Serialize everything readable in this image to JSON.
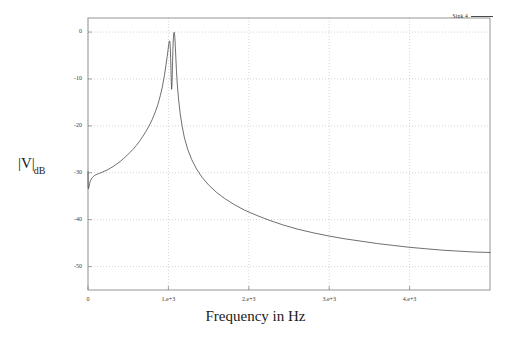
{
  "figure": {
    "background_color": "#ffffff",
    "frame_color": "#8a8a8a",
    "grid_color": "#b9b9b9",
    "curve_color": "#4a4a4a"
  },
  "chart_data": {
    "type": "line",
    "title": "",
    "subtitle": "",
    "xlabel": "Frequency in Hz",
    "ylabel": "|V|",
    "ylabel_subscript": "dB",
    "grid": true,
    "grid_style": "dotted",
    "legend_position": "top-right",
    "xlim": [
      0,
      5000
    ],
    "ylim": [
      -55,
      3
    ],
    "xticks": [
      0,
      1000,
      2000,
      3000,
      4000
    ],
    "xtick_labels": [
      "0",
      "1.e+3",
      "2.e+3",
      "3.e+3",
      "4.e+3"
    ],
    "yticks": [
      0,
      -10,
      -20,
      -30,
      -40,
      -50
    ],
    "ytick_labels": [
      "0",
      "-10",
      "-20",
      "-30",
      "-40",
      "-50"
    ],
    "series": [
      {
        "name": "Sink 4",
        "color": "#4a4a4a",
        "x": [
          0,
          2,
          6,
          12,
          20,
          30,
          45,
          60,
          80,
          100,
          130,
          160,
          200,
          240,
          280,
          320,
          360,
          400,
          440,
          480,
          520,
          560,
          600,
          640,
          680,
          720,
          760,
          800,
          840,
          870,
          900,
          925,
          950,
          970,
          985,
          995,
          1002,
          1008,
          1012,
          1016,
          1020,
          1024,
          1028,
          1032,
          1036,
          1040,
          1044,
          1048,
          1052,
          1056,
          1060,
          1064,
          1068,
          1072,
          1076,
          1080,
          1086,
          1092,
          1100,
          1110,
          1125,
          1145,
          1170,
          1200,
          1240,
          1290,
          1350,
          1420,
          1500,
          1600,
          1700,
          1820,
          1950,
          2100,
          2250,
          2420,
          2600,
          2800,
          3000,
          3200,
          3400,
          3600,
          3800,
          4000,
          4200,
          4400,
          4600,
          4800,
          5000
        ],
        "y": [
          -29.8,
          -33.2,
          -33.4,
          -33.0,
          -32.3,
          -31.7,
          -31.2,
          -30.9,
          -30.6,
          -30.4,
          -30.2,
          -30.0,
          -29.7,
          -29.4,
          -29.0,
          -28.6,
          -28.1,
          -27.6,
          -27.0,
          -26.4,
          -25.7,
          -25.0,
          -24.2,
          -23.3,
          -22.3,
          -21.2,
          -20.0,
          -18.6,
          -16.9,
          -15.4,
          -13.5,
          -11.7,
          -9.3,
          -7.0,
          -5.2,
          -3.9,
          -2.9,
          -2.2,
          -1.9,
          -1.9,
          -2.4,
          -3.6,
          -5.6,
          -8.2,
          -10.7,
          -12.2,
          -11.4,
          -9.0,
          -6.2,
          -3.7,
          -1.9,
          -0.8,
          -0.2,
          -0.05,
          -0.3,
          -1.1,
          -3.0,
          -5.3,
          -8.2,
          -11.0,
          -14.0,
          -17.2,
          -20.0,
          -22.6,
          -25.0,
          -27.2,
          -29.2,
          -31.0,
          -32.6,
          -34.2,
          -35.5,
          -36.8,
          -38.0,
          -39.1,
          -40.1,
          -41.1,
          -42.0,
          -42.8,
          -43.5,
          -44.1,
          -44.6,
          -45.1,
          -45.5,
          -45.9,
          -46.2,
          -46.5,
          -46.7,
          -46.9,
          -47.0
        ]
      }
    ]
  },
  "legend": {
    "entries": [
      {
        "label": "Sink 4"
      }
    ]
  }
}
